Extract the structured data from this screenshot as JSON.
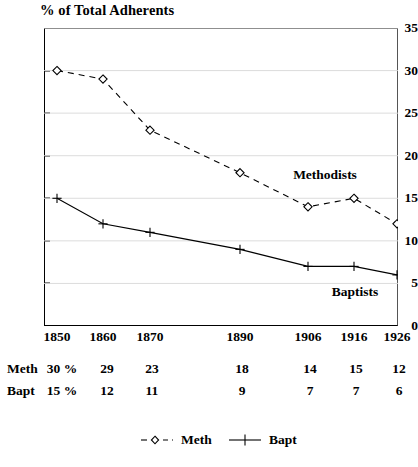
{
  "chart_data": {
    "type": "line",
    "title": "% of Total Adherents",
    "xlabel": "",
    "ylabel": "% of Total Adherents",
    "x": [
      1850,
      1860,
      1870,
      1890,
      1906,
      1916,
      1926
    ],
    "categories": [
      "1850",
      "1860",
      "1870",
      "1890",
      "1906",
      "1916",
      "1926"
    ],
    "series": [
      {
        "name": "Meth",
        "plot_label": "Methodists",
        "values": [
          30,
          29,
          23,
          18,
          14,
          15,
          12
        ],
        "linestyle": "dashed",
        "marker": "diamond",
        "color": "#000000"
      },
      {
        "name": "Bapt",
        "plot_label": "Baptists",
        "values": [
          15,
          12,
          11,
          9,
          7,
          7,
          6
        ],
        "linestyle": "solid",
        "marker": "plus",
        "color": "#000000"
      }
    ],
    "ylim": [
      0,
      35
    ],
    "yticks": [
      0,
      5,
      10,
      15,
      20,
      25,
      30,
      35
    ],
    "ytick_labels": [
      "0",
      "5",
      "10",
      "15",
      "20",
      "25",
      "30",
      "35"
    ],
    "xlim": [
      1845,
      1931
    ],
    "grid": true,
    "grid_axis": "y",
    "legend_position": "bottom"
  },
  "axis": {
    "y_ticks": [
      "0",
      "5",
      "10",
      "15",
      "20",
      "25",
      "30",
      "35"
    ],
    "x_ticks": [
      "1850",
      "1860",
      "1870",
      "1890",
      "1906",
      "1916",
      "1926"
    ]
  },
  "annotations": {
    "methodists": "Methodists",
    "baptists": "Baptists"
  },
  "data_table": {
    "rows": [
      {
        "label": "Meth",
        "cells": [
          "30 %",
          "29",
          "23",
          "18",
          "14",
          "15",
          "12"
        ]
      },
      {
        "label": "Bapt",
        "cells": [
          "15 %",
          "12",
          "11",
          "9",
          "7",
          "7",
          "6"
        ]
      }
    ]
  },
  "legend": {
    "entries": [
      {
        "label": "Meth",
        "marker": "diamond",
        "linestyle": "dashed"
      },
      {
        "label": "Bapt",
        "marker": "plus",
        "linestyle": "solid"
      }
    ]
  },
  "colors": {
    "ink": "#000000",
    "grid": "#d8d8d8",
    "frame_light": "#555555"
  }
}
